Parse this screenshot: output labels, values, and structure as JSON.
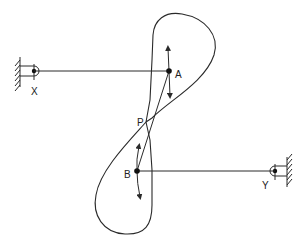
{
  "diagram": {
    "type": "four-bar linkage with figure-eight coupler curve",
    "colors": {
      "stroke": "#2a2a2a",
      "background": "#ffffff"
    },
    "labels": {
      "pivot_x": "X",
      "pivot_y": "Y",
      "joint_a": "A",
      "joint_b": "B",
      "crossover_point": "P"
    },
    "nodes": [
      {
        "id": "X",
        "kind": "fixed-pivot",
        "x": 34,
        "y": 71
      },
      {
        "id": "A",
        "kind": "moving-joint",
        "x": 169,
        "y": 71
      },
      {
        "id": "P",
        "kind": "coupler-point",
        "x": 146,
        "y": 122
      },
      {
        "id": "B",
        "kind": "moving-joint",
        "x": 137,
        "y": 171
      },
      {
        "id": "Y",
        "kind": "fixed-pivot",
        "x": 275,
        "y": 171
      }
    ],
    "edges": [
      {
        "from": "X",
        "to": "A",
        "kind": "crank"
      },
      {
        "from": "Y",
        "to": "B",
        "kind": "rocker"
      },
      {
        "from": "A",
        "to": "B",
        "kind": "coupler"
      }
    ],
    "curves": [
      {
        "name": "figure-eight coupler curve",
        "crosses_at": "P"
      }
    ],
    "motion_arrows": [
      {
        "at": "A",
        "directions": [
          "up",
          "down"
        ]
      },
      {
        "at": "B",
        "directions": [
          "up",
          "down"
        ]
      }
    ]
  }
}
